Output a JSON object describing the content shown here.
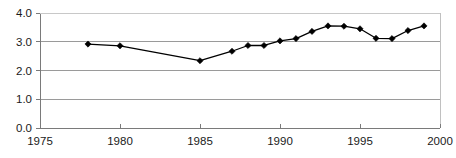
{
  "chart_data": {
    "type": "line",
    "title": "",
    "subtitle": "",
    "xlabel": "",
    "ylabel": "",
    "xlim": [
      1975,
      2000
    ],
    "ylim": [
      0.0,
      4.0
    ],
    "grid": true,
    "legend": false,
    "legend_position": "none",
    "xticks": [
      1975,
      1980,
      1985,
      1990,
      1995,
      2000
    ],
    "xtick_labels": [
      "1975",
      "1980",
      "1985",
      "1990",
      "1995",
      "2000"
    ],
    "yticks": [
      0.0,
      1.0,
      2.0,
      3.0,
      4.0
    ],
    "ytick_labels": [
      "0.0",
      "1.0",
      "2.0",
      "3.0",
      "4.0"
    ],
    "series": [
      {
        "name": "series-1",
        "marker": "diamond",
        "color": "#000000",
        "x": [
          1978,
          1980,
          1985,
          1987,
          1988,
          1989,
          1990,
          1991,
          1992,
          1993,
          1994,
          1995,
          1996,
          1997,
          1998,
          1999
        ],
        "values": [
          2.92,
          2.86,
          2.34,
          2.67,
          2.87,
          2.87,
          3.03,
          3.11,
          3.36,
          3.55,
          3.54,
          3.45,
          3.12,
          3.11,
          3.39,
          3.55
        ]
      }
    ]
  },
  "style": {
    "line_color": "#000000",
    "marker_color": "#000000",
    "grid_color": "#9a9a9a",
    "axis_color": "#7a7a7a",
    "plot_background": "#ffffff",
    "text_color": "#1a1a1a"
  },
  "geometry": {
    "plot_left": 40,
    "plot_right": 440,
    "plot_top": 13,
    "plot_bottom": 128
  }
}
